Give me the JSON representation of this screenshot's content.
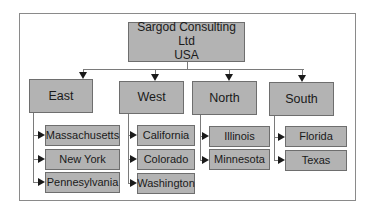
{
  "diagram": {
    "type": "org-chart",
    "root": {
      "line1": "Sargod Consulting Ltd",
      "line2": "USA"
    },
    "regions": [
      {
        "label": "East",
        "children": [
          "Massachusetts",
          "New York",
          "Pennesylvania"
        ]
      },
      {
        "label": "West",
        "children": [
          "California",
          "Colorado",
          "Washington"
        ]
      },
      {
        "label": "North",
        "children": [
          "Illinois",
          "Minnesota"
        ]
      },
      {
        "label": "South",
        "children": [
          "Florida",
          "Texas"
        ]
      }
    ],
    "colors": {
      "box_fill": "#b3b3b3",
      "box_border": "#6e6e6e",
      "connector": "#7a7a7a",
      "arrowhead": "#1a1a1a",
      "frame_border": "#8a8a8a"
    }
  }
}
